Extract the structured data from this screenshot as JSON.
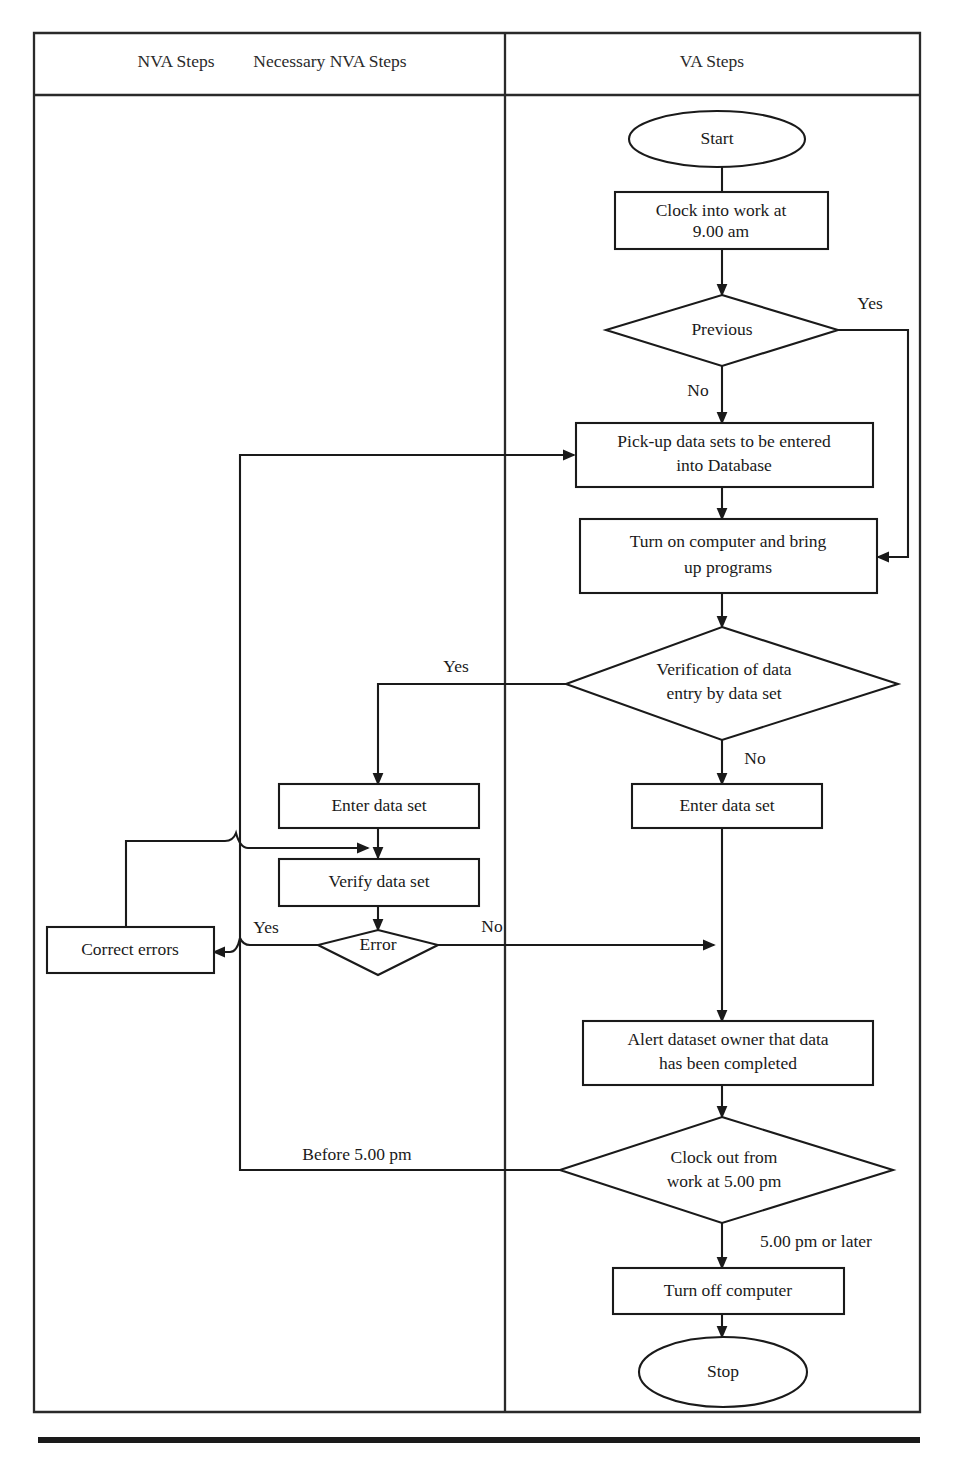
{
  "diagram": {
    "columns": [
      {
        "id": "nva",
        "label_a": "NVA Steps",
        "label_b": "Necessary NVA Steps"
      },
      {
        "id": "va",
        "label": "VA Steps"
      }
    ],
    "nodes": [
      {
        "id": "start",
        "type": "terminator",
        "text": "Start",
        "column": "va"
      },
      {
        "id": "clock-in",
        "type": "process",
        "line1": "Clock into work at",
        "line2": "9.00 am",
        "column": "va"
      },
      {
        "id": "previous",
        "type": "decision",
        "text": "Previous",
        "column": "va"
      },
      {
        "id": "pickup",
        "type": "process",
        "line1": "Pick-up data sets to be entered",
        "line2": "into Database",
        "column": "va"
      },
      {
        "id": "turn-on",
        "type": "process",
        "line1": "Turn on computer and bring",
        "line2": "up programs",
        "column": "va"
      },
      {
        "id": "verification",
        "type": "decision",
        "line1": "Verification of data",
        "line2": "entry by data set",
        "column": "va"
      },
      {
        "id": "enter-va",
        "type": "process",
        "text": "Enter data set",
        "column": "va"
      },
      {
        "id": "enter-nva",
        "type": "process",
        "text": "Enter data set",
        "column": "nva"
      },
      {
        "id": "verify-nva",
        "type": "process",
        "text": "Verify data set",
        "column": "nva"
      },
      {
        "id": "error",
        "type": "decision",
        "text": "Error",
        "column": "nva"
      },
      {
        "id": "correct-errors",
        "type": "process",
        "text": "Correct errors",
        "column": "nva"
      },
      {
        "id": "alert-owner",
        "type": "process",
        "line1": "Alert dataset owner that data",
        "line2": "has been completed",
        "column": "va"
      },
      {
        "id": "clock-out",
        "type": "decision",
        "line1": "Clock out from",
        "line2": "work at 5.00 pm",
        "column": "va"
      },
      {
        "id": "turn-off",
        "type": "process",
        "text": "Turn off computer",
        "column": "va"
      },
      {
        "id": "stop",
        "type": "terminator",
        "text": "Stop",
        "column": "va"
      }
    ],
    "edge_labels": [
      {
        "id": "previous-yes",
        "text": "Yes",
        "from": "previous",
        "to": "turn-on"
      },
      {
        "id": "previous-no",
        "text": "No",
        "from": "previous",
        "to": "pickup"
      },
      {
        "id": "verification-yes",
        "text": "Yes",
        "from": "verification",
        "to": "enter-nva"
      },
      {
        "id": "verification-no",
        "text": "No",
        "from": "verification",
        "to": "enter-va"
      },
      {
        "id": "error-yes",
        "text": "Yes",
        "from": "error",
        "to": "correct-errors"
      },
      {
        "id": "error-no",
        "text": "No",
        "from": "error",
        "to": "alert-owner"
      },
      {
        "id": "clockout-before",
        "text": "Before 5.00 pm",
        "from": "clock-out",
        "to": "pickup"
      },
      {
        "id": "clockout-after",
        "text": "5.00 pm or later",
        "from": "clock-out",
        "to": "turn-off"
      }
    ]
  }
}
